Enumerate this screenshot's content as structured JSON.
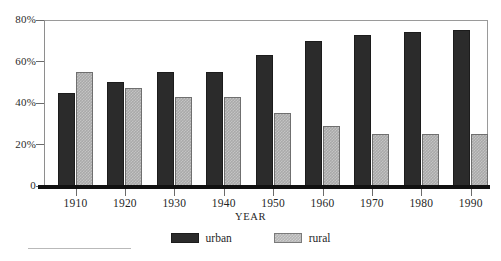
{
  "chart_data": {
    "type": "bar",
    "title": "",
    "subtitle": "",
    "xlabel": "YEAR",
    "ylabel": "",
    "categories": [
      "1910",
      "1920",
      "1930",
      "1940",
      "1950",
      "1960",
      "1970",
      "1980",
      "1990"
    ],
    "series": [
      {
        "name": "urban",
        "color": "#2b2b2b",
        "values": [
          45,
          50,
          55,
          55,
          63,
          70,
          73,
          74,
          75
        ]
      },
      {
        "name": "rural",
        "color": "#a9a9a9",
        "values": [
          55,
          47,
          43,
          43,
          35,
          29,
          25,
          25,
          25
        ]
      }
    ],
    "ylim": [
      0,
      80
    ],
    "yticks": [
      0,
      20,
      40,
      60,
      80
    ],
    "ytick_labels": [
      "0",
      "20%",
      "40%",
      "60%",
      "80%"
    ],
    "grid": false,
    "legend_position": "bottom-center",
    "value_unit": "percent"
  },
  "axes": {
    "y_labels": [
      "80%",
      "60%",
      "40%",
      "20%",
      "0"
    ],
    "x_labels": [
      "1910",
      "1920",
      "1930",
      "1940",
      "1950",
      "1960",
      "1970",
      "1980",
      "1990"
    ],
    "x_title": "YEAR"
  },
  "legend": {
    "items": [
      {
        "label": "urban",
        "swatch": "urban-swatch"
      },
      {
        "label": "rural",
        "swatch": "rural-swatch"
      }
    ]
  }
}
